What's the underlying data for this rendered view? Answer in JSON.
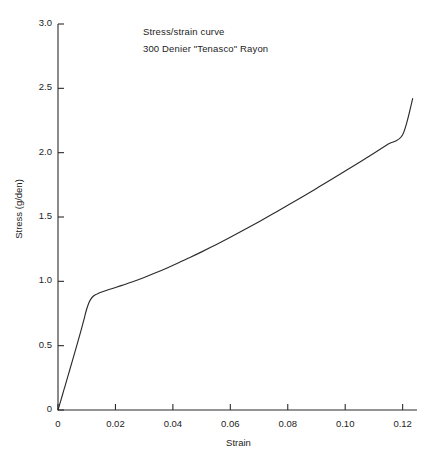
{
  "chart_data": {
    "type": "line",
    "title": "Stress/strain curve",
    "subtitle": "300 Denier \"Tenasco\" Rayon",
    "xlabel": "Strain",
    "ylabel": "Stress (g/den)",
    "xlim": [
      0,
      0.125
    ],
    "ylim": [
      0,
      3.0
    ],
    "xticks": [
      0,
      0.02,
      0.04,
      0.06,
      0.08,
      0.1,
      0.12
    ],
    "xticklabels": [
      "0",
      "0.02",
      "0.04",
      "0.06",
      "0.08",
      "0.10",
      "0.12"
    ],
    "yticks": [
      0,
      0.5,
      1.0,
      1.5,
      2.0,
      2.5,
      3.0
    ],
    "yticklabels": [
      "0",
      "0.5",
      "1.0",
      "1.5",
      "2.0",
      "2.5",
      "3.0"
    ],
    "grid": false,
    "legend": false,
    "line_color": "#2b2b2b",
    "series": [
      {
        "name": "Stress/strain",
        "x": [
          0.0,
          0.001,
          0.002,
          0.003,
          0.004,
          0.005,
          0.006,
          0.007,
          0.008,
          0.009,
          0.0095,
          0.01,
          0.0105,
          0.011,
          0.0115,
          0.012,
          0.013,
          0.014,
          0.015,
          0.016,
          0.018,
          0.02,
          0.023,
          0.026,
          0.03,
          0.034,
          0.038,
          0.042,
          0.046,
          0.05,
          0.055,
          0.06,
          0.065,
          0.07,
          0.075,
          0.08,
          0.085,
          0.09,
          0.095,
          0.1,
          0.105,
          0.11,
          0.115,
          0.12
        ],
        "y": [
          0.0,
          0.075,
          0.152,
          0.228,
          0.305,
          0.382,
          0.459,
          0.537,
          0.617,
          0.7,
          0.745,
          0.785,
          0.818,
          0.845,
          0.864,
          0.878,
          0.895,
          0.906,
          0.915,
          0.923,
          0.938,
          0.952,
          0.974,
          0.997,
          1.03,
          1.066,
          1.104,
          1.144,
          1.186,
          1.229,
          1.285,
          1.343,
          1.403,
          1.464,
          1.527,
          1.591,
          1.656,
          1.722,
          1.789,
          1.857,
          1.926,
          1.996,
          2.067,
          2.139
        ]
      }
    ],
    "endpoint": {
      "x": 0.1235,
      "y": 2.42
    }
  },
  "axis": {
    "x_axis_name": "strain-axis",
    "y_axis_name": "stress-axis"
  }
}
